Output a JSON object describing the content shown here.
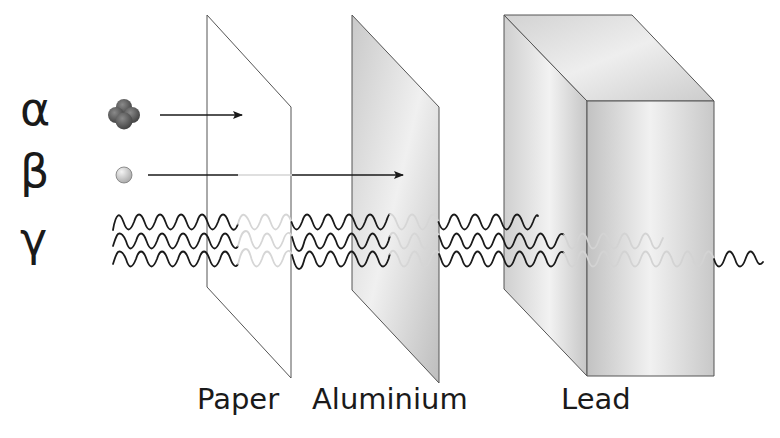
{
  "diagram": {
    "radiation_types": [
      {
        "symbol": "α",
        "name": "alpha",
        "particle": "helium nucleus (4 balls)",
        "stopped_by": "Paper"
      },
      {
        "symbol": "β",
        "name": "beta",
        "particle": "electron (single ball)",
        "stopped_by": "Aluminium"
      },
      {
        "symbol": "γ",
        "name": "gamma",
        "particle": "wave",
        "stopped_by": "Lead (partially passes)"
      }
    ],
    "barriers": [
      {
        "label": "Paper"
      },
      {
        "label": "Aluminium"
      },
      {
        "label": "Lead"
      }
    ],
    "colors": {
      "line": "#1a1a1a",
      "faded_line": "#d4d4d4",
      "alpha_ball": "#555555",
      "beta_ball": "#c8c8c8",
      "aluminium": "#d0d0d0",
      "lead": "#c4c4c4"
    }
  }
}
